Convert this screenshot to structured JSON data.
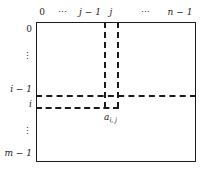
{
  "figure": {
    "type": "matrix-index-diagram"
  },
  "matrix": {
    "shaded_fill": "#e9e9e9",
    "border_color": "#1a1a1a",
    "background": "#ffffff"
  },
  "columns": {
    "labels": [
      {
        "text": "0",
        "x": 42,
        "italic": false,
        "ellipsis": false
      },
      {
        "text": "⋯",
        "x": 63,
        "italic": false,
        "ellipsis": true
      },
      {
        "text": "j − 1",
        "x": 90,
        "italic": true,
        "ellipsis": false
      },
      {
        "text": "j",
        "x": 111,
        "italic": true,
        "ellipsis": false
      },
      {
        "text": "⋯",
        "x": 146,
        "italic": false,
        "ellipsis": true
      },
      {
        "text": "n − 1",
        "x": 180,
        "italic": true,
        "ellipsis": false
      }
    ]
  },
  "rows": {
    "labels": [
      {
        "text": "0",
        "y": 29,
        "italic": false,
        "ellipsis": false
      },
      {
        "text": "⋮",
        "y": 56,
        "italic": false,
        "ellipsis": true
      },
      {
        "text": "i − 1",
        "y": 89,
        "italic": true,
        "ellipsis": false
      },
      {
        "text": "i",
        "y": 104,
        "italic": true,
        "ellipsis": false
      },
      {
        "text": "⋮",
        "y": 131,
        "italic": false,
        "ellipsis": true
      },
      {
        "text": "m − 1",
        "y": 153,
        "italic": true,
        "ellipsis": false
      }
    ]
  },
  "cell": {
    "base": "a",
    "subscript": "i, j",
    "full_label": "a i, j"
  }
}
